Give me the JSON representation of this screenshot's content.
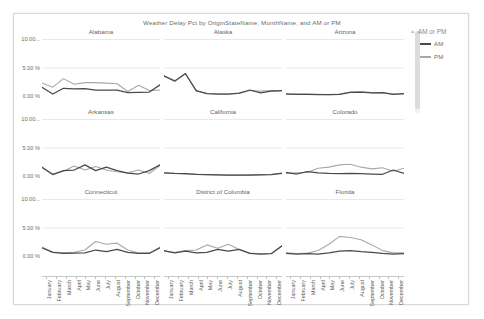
{
  "report": {
    "title": "Weather Delay Pct by OriginStateName, MonthName, and AM or PM"
  },
  "legend": {
    "title": "AM or PM",
    "collapse_icon": "▲",
    "items": [
      {
        "label": "AM",
        "color": "#4a4a4a"
      },
      {
        "label": "PM",
        "color": "#a8a8a8"
      }
    ]
  },
  "axes": {
    "y_ticks": [
      "10.00...",
      "5.00 %",
      "0.00 %"
    ],
    "y_values": [
      10,
      5,
      0
    ],
    "x_ticks": [
      "January",
      "February",
      "March",
      "April",
      "May",
      "June",
      "July",
      "August",
      "September",
      "October",
      "November",
      "December"
    ]
  },
  "chart_data": {
    "type": "line",
    "title": "Weather Delay Pct by OriginStateName, MonthName, and AM or PM",
    "xlabel": "MonthName",
    "ylabel": "Weather Delay Pct",
    "ylim": [
      0,
      10
    ],
    "grid": true,
    "legend_position": "right",
    "categories": [
      "January",
      "February",
      "March",
      "April",
      "May",
      "June",
      "July",
      "August",
      "September",
      "October",
      "November",
      "December"
    ],
    "panels": [
      {
        "title": "Alabama",
        "series": [
          {
            "name": "AM",
            "values": [
              1.55,
              0.35,
              1.35,
              1.25,
              1.3,
              1.05,
              1.05,
              1.05,
              0.6,
              0.65,
              0.7,
              1.95
            ]
          },
          {
            "name": "PM",
            "values": [
              2.3,
              1.55,
              3.05,
              2.05,
              2.35,
              2.35,
              2.25,
              2.15,
              0.8,
              1.9,
              0.95,
              1.05
            ]
          }
        ]
      },
      {
        "title": "Alaska",
        "series": [
          {
            "name": "AM",
            "values": [
              3.55,
              2.6,
              3.95,
              0.95,
              0.4,
              0.35,
              0.35,
              0.5,
              1.05,
              0.55,
              0.85,
              0.95
            ]
          },
          {
            "name": "PM",
            "values": [
              3.45,
              2.7,
              3.85,
              0.9,
              0.45,
              0.4,
              0.35,
              0.45,
              0.95,
              0.85,
              0.95,
              0.9
            ]
          }
        ]
      },
      {
        "title": "Arizona",
        "series": [
          {
            "name": "AM",
            "values": [
              0.35,
              0.3,
              0.3,
              0.25,
              0.25,
              0.3,
              0.65,
              0.7,
              0.55,
              0.6,
              0.3,
              0.4
            ]
          },
          {
            "name": "PM",
            "values": [
              0.4,
              0.35,
              0.35,
              0.3,
              0.25,
              0.35,
              0.7,
              0.75,
              0.6,
              0.55,
              0.35,
              0.35
            ]
          }
        ]
      },
      {
        "title": "Arkansas",
        "series": [
          {
            "name": "AM",
            "values": [
              1.55,
              0.25,
              0.95,
              1.05,
              1.95,
              0.95,
              1.55,
              0.95,
              0.5,
              0.35,
              0.95,
              1.95
            ]
          },
          {
            "name": "PM",
            "values": [
              1.45,
              0.35,
              0.85,
              1.75,
              1.05,
              1.65,
              1.05,
              0.75,
              0.55,
              1.05,
              0.45,
              1.85
            ]
          }
        ]
      },
      {
        "title": "California",
        "series": [
          {
            "name": "AM",
            "values": [
              0.55,
              0.45,
              0.4,
              0.3,
              0.25,
              0.2,
              0.15,
              0.15,
              0.15,
              0.2,
              0.25,
              0.45
            ]
          },
          {
            "name": "PM",
            "values": [
              0.5,
              0.45,
              0.35,
              0.3,
              0.25,
              0.2,
              0.15,
              0.15,
              0.2,
              0.25,
              0.3,
              0.5
            ]
          }
        ]
      },
      {
        "title": "Colorado",
        "series": [
          {
            "name": "AM",
            "values": [
              0.65,
              0.35,
              0.75,
              0.55,
              0.45,
              0.4,
              0.45,
              0.4,
              0.35,
              0.3,
              1.05,
              0.45
            ]
          },
          {
            "name": "PM",
            "values": [
              0.45,
              0.55,
              0.65,
              1.35,
              1.55,
              1.95,
              2.05,
              1.55,
              1.25,
              1.45,
              0.85,
              1.35
            ]
          }
        ]
      },
      {
        "title": "Connecticut",
        "series": [
          {
            "name": "AM",
            "values": [
              1.45,
              0.65,
              0.45,
              0.5,
              0.55,
              1.05,
              0.75,
              1.15,
              0.65,
              0.45,
              0.45,
              1.45
            ]
          },
          {
            "name": "PM",
            "values": [
              1.55,
              0.7,
              0.55,
              0.65,
              1.05,
              2.55,
              2.05,
              2.25,
              1.05,
              0.5,
              0.55,
              1.55
            ]
          }
        ]
      },
      {
        "title": "District of Columbia",
        "series": [
          {
            "name": "AM",
            "values": [
              0.95,
              0.55,
              0.85,
              0.55,
              0.65,
              1.15,
              0.85,
              1.15,
              0.45,
              0.35,
              0.4,
              1.75
            ]
          },
          {
            "name": "PM",
            "values": [
              0.85,
              0.6,
              0.95,
              1.05,
              1.95,
              1.35,
              2.05,
              1.15,
              0.5,
              0.4,
              0.45,
              1.85
            ]
          }
        ]
      },
      {
        "title": "Florida",
        "series": [
          {
            "name": "AM",
            "values": [
              0.45,
              0.35,
              0.4,
              0.35,
              0.55,
              0.85,
              0.95,
              0.75,
              0.65,
              0.45,
              0.35,
              0.4
            ]
          },
          {
            "name": "PM",
            "values": [
              0.55,
              0.45,
              0.5,
              0.95,
              2.05,
              3.45,
              3.25,
              2.85,
              1.95,
              0.95,
              0.55,
              0.55
            ]
          }
        ]
      }
    ]
  }
}
